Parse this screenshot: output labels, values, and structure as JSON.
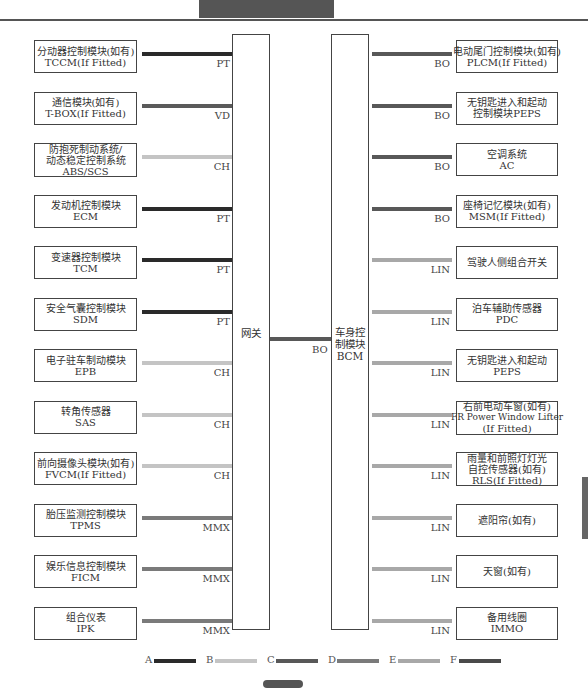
{
  "colors": {
    "PT": "#2a2a2a",
    "VD": "#5a5a5a",
    "CH": "#c4c4c4",
    "MMX": "#7a7a7a",
    "BO": "#585858",
    "LIN": "#a8a8a8"
  },
  "gateway": {
    "label": "网关"
  },
  "bcm": {
    "label_lines": [
      "车身控",
      "制模块",
      "BCM"
    ]
  },
  "link": {
    "protocol": "BO"
  },
  "left_modules": [
    {
      "lines": [
        "分动器控制模块(如有)",
        "TCCM(If Fitted)"
      ],
      "protocol": "PT"
    },
    {
      "lines": [
        "通信模块(如有)",
        "T-BOX(If Fitted)"
      ],
      "protocol": "VD"
    },
    {
      "lines": [
        "防抱死制动系统/",
        "动态稳定控制系统",
        "ABS/SCS"
      ],
      "protocol": "CH"
    },
    {
      "lines": [
        "发动机控制模块",
        "ECM"
      ],
      "protocol": "PT"
    },
    {
      "lines": [
        "变速器控制模块",
        "TCM"
      ],
      "protocol": "PT"
    },
    {
      "lines": [
        "安全气囊控制模块",
        "SDM"
      ],
      "protocol": "PT"
    },
    {
      "lines": [
        "电子驻车制动模块",
        "EPB"
      ],
      "protocol": "CH"
    },
    {
      "lines": [
        "转角传感器",
        "SAS"
      ],
      "protocol": "CH"
    },
    {
      "lines": [
        "前向摄像头模块(如有)",
        "FVCM(If Fitted)"
      ],
      "protocol": "CH"
    },
    {
      "lines": [
        "胎压监测控制模块",
        "TPMS"
      ],
      "protocol": "MMX"
    },
    {
      "lines": [
        "娱乐信息控制模块",
        "FICM"
      ],
      "protocol": "MMX"
    },
    {
      "lines": [
        "组合仪表",
        "IPK"
      ],
      "protocol": "MMX"
    }
  ],
  "right_modules": [
    {
      "lines": [
        "电动尾门控制模块(如有)",
        "PLCM(If Fitted)"
      ],
      "protocol": "BO"
    },
    {
      "lines": [
        "无钥匙进入和起动",
        "控制模块PEPS"
      ],
      "protocol": "BO"
    },
    {
      "lines": [
        "空调系统",
        "AC"
      ],
      "protocol": "BO"
    },
    {
      "lines": [
        "座椅记忆模块(如有)",
        "MSM(If Fitted)"
      ],
      "protocol": "BO"
    },
    {
      "lines": [
        "驾驶人侧组合开关"
      ],
      "protocol": "LIN"
    },
    {
      "lines": [
        "泊车辅助传感器",
        "PDC"
      ],
      "protocol": "LIN"
    },
    {
      "lines": [
        "无钥匙进入和起动",
        "PEPS"
      ],
      "protocol": "LIN"
    },
    {
      "lines": [
        "右前电动车窗(如有)",
        "FR Power Window Lifter",
        "(If Fitted)"
      ],
      "protocol": "LIN"
    },
    {
      "lines": [
        "雨量和前照灯灯光",
        "自控传感器(如有)",
        "RLS(If Fitted)"
      ],
      "protocol": "LIN"
    },
    {
      "lines": [
        "遮阳帘(如有)"
      ],
      "protocol": "LIN"
    },
    {
      "lines": [
        "天窗(如有)"
      ],
      "protocol": "LIN"
    },
    {
      "lines": [
        "备用线圈",
        "IMMO"
      ],
      "protocol": "LIN"
    }
  ],
  "legend": [
    {
      "letter": "A",
      "color": "#2a2a2a"
    },
    {
      "letter": "B",
      "color": "#c4c4c4"
    },
    {
      "letter": "C",
      "color": "#585858"
    },
    {
      "letter": "D",
      "color": "#7a7a7a"
    },
    {
      "letter": "E",
      "color": "#a8a8a8"
    },
    {
      "letter": "F",
      "color": "#4a4a4a"
    }
  ]
}
